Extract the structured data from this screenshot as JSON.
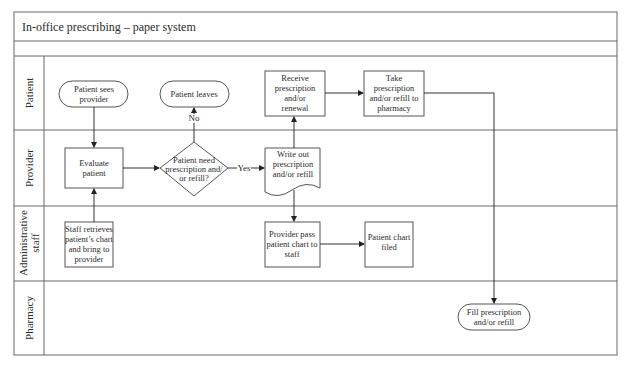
{
  "title": "In-office prescribing – paper system",
  "lanes": [
    {
      "id": "patient",
      "label": "Patient"
    },
    {
      "id": "provider",
      "label": "Provider"
    },
    {
      "id": "admin",
      "label_line1": "Administrative",
      "label_line2": "staff"
    },
    {
      "id": "pharmacy",
      "label": "Pharmacy"
    }
  ],
  "nodes": {
    "patient_sees_provider": {
      "line1": "Patient sees",
      "line2": "provider"
    },
    "patient_leaves": {
      "line1": "Patient leaves"
    },
    "receive_prescription": {
      "line1": "Receive",
      "line2": "prescription",
      "line3": "and/or",
      "line4": "renewal"
    },
    "take_prescription": {
      "line1": "Take",
      "line2": "prescription",
      "line3": "and/or refill to",
      "line4": "pharmacy"
    },
    "evaluate_patient": {
      "line1": "Evaluate",
      "line2": "patient"
    },
    "decision": {
      "line1": "Patient need",
      "line2": "prescription and/",
      "line3": "or refill?"
    },
    "write_out": {
      "line1": "Write out",
      "line2": "prescription",
      "line3": "and/or refill"
    },
    "staff_retrieves": {
      "line1": "Staff retrieves",
      "line2": "patient’s chart",
      "line3": "and bring to",
      "line4": "provider"
    },
    "provider_pass": {
      "line1": "Provider pass",
      "line2": "patient chart to",
      "line3": "staff"
    },
    "chart_filed": {
      "line1": "Patient chart",
      "line2": "filed"
    },
    "fill_prescription": {
      "line1": "Fill prescription",
      "line2": "and/or refill"
    }
  },
  "edge_labels": {
    "yes": "Yes",
    "no": "No"
  },
  "colors": {
    "line": "#555555",
    "text": "#2a2a2a",
    "background": "#ffffff"
  }
}
